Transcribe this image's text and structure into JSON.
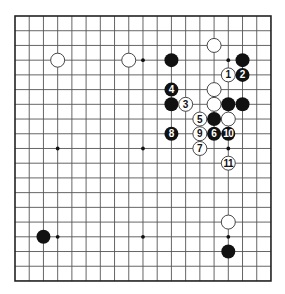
{
  "board": {
    "size": 19,
    "origin_x": 15,
    "origin_y": 16,
    "step_x": 14.22,
    "step_y": 14.72,
    "stone_radius": 7,
    "line_color": "#555555",
    "border_color": "#222222",
    "black_color": "#111111",
    "white_fill": "#ffffff",
    "white_stroke": "#333333"
  },
  "star_points": [
    [
      3,
      3
    ],
    [
      9,
      3
    ],
    [
      15,
      3
    ],
    [
      3,
      9
    ],
    [
      9,
      9
    ],
    [
      15,
      9
    ],
    [
      3,
      15
    ],
    [
      9,
      15
    ],
    [
      15,
      15
    ]
  ],
  "stones": [
    {
      "color": "white",
      "x": 3,
      "y": 3,
      "label": ""
    },
    {
      "color": "white",
      "x": 8,
      "y": 3,
      "label": ""
    },
    {
      "color": "white",
      "x": 14,
      "y": 2,
      "label": ""
    },
    {
      "color": "black",
      "x": 11,
      "y": 3,
      "label": ""
    },
    {
      "color": "black",
      "x": 16,
      "y": 3,
      "label": ""
    },
    {
      "color": "white",
      "x": 15,
      "y": 4,
      "label": "1"
    },
    {
      "color": "black",
      "x": 16,
      "y": 4,
      "label": "2"
    },
    {
      "color": "black",
      "x": 11,
      "y": 5,
      "label": "4"
    },
    {
      "color": "white",
      "x": 14,
      "y": 5,
      "label": ""
    },
    {
      "color": "black",
      "x": 11,
      "y": 6,
      "label": ""
    },
    {
      "color": "white",
      "x": 12,
      "y": 6,
      "label": "3"
    },
    {
      "color": "white",
      "x": 14,
      "y": 6,
      "label": ""
    },
    {
      "color": "black",
      "x": 15,
      "y": 6,
      "label": ""
    },
    {
      "color": "black",
      "x": 16,
      "y": 6,
      "label": ""
    },
    {
      "color": "white",
      "x": 13,
      "y": 7,
      "label": "5"
    },
    {
      "color": "black",
      "x": 14,
      "y": 7,
      "label": ""
    },
    {
      "color": "white",
      "x": 15,
      "y": 7,
      "label": ""
    },
    {
      "color": "black",
      "x": 11,
      "y": 8,
      "label": "8"
    },
    {
      "color": "white",
      "x": 13,
      "y": 8,
      "label": "9"
    },
    {
      "color": "black",
      "x": 14,
      "y": 8,
      "label": "6"
    },
    {
      "color": "black",
      "x": 15,
      "y": 8,
      "label": "10"
    },
    {
      "color": "white",
      "x": 13,
      "y": 9,
      "label": "7"
    },
    {
      "color": "white",
      "x": 15,
      "y": 10,
      "label": "11"
    },
    {
      "color": "white",
      "x": 15,
      "y": 14,
      "label": ""
    },
    {
      "color": "black",
      "x": 2,
      "y": 15,
      "label": ""
    },
    {
      "color": "black",
      "x": 15,
      "y": 16,
      "label": ""
    }
  ]
}
